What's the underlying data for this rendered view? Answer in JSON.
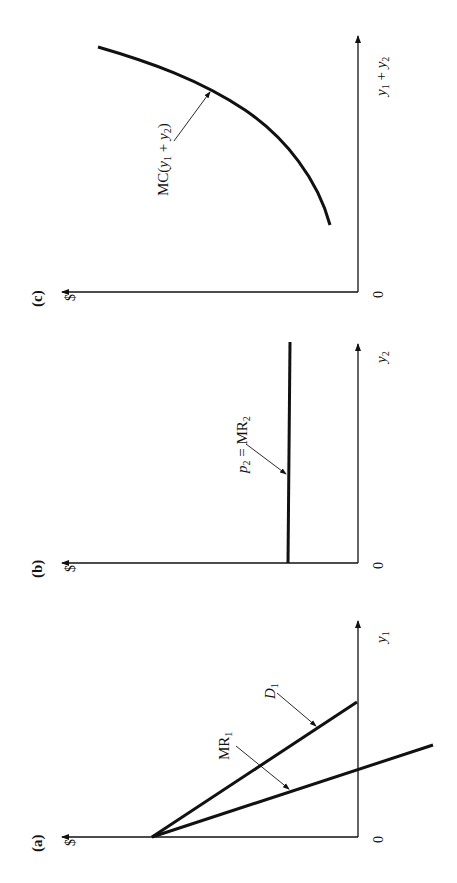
{
  "figure": {
    "ink_color": "#111111",
    "panels": [
      {
        "id": "a",
        "panel_label": "(a)",
        "y_axis_label": "$",
        "x_axis_label": "y",
        "x_axis_sub": "1",
        "origin_label": "0",
        "curves": [
          {
            "name": "D",
            "sub": "1",
            "type": "linear-downward",
            "desc": "Demand curve for market 1"
          },
          {
            "name": "MR",
            "sub": "1",
            "type": "linear-downward-steeper",
            "desc": "Marginal revenue for market 1"
          }
        ]
      },
      {
        "id": "b",
        "panel_label": "(b)",
        "y_axis_label": "$",
        "x_axis_label": "y",
        "x_axis_sub": "2",
        "origin_label": "0",
        "curves": [
          {
            "name_p": "p",
            "p_sub": "2",
            "eq": " = ",
            "name_mr": "MR",
            "mr_sub": "2",
            "type": "horizontal",
            "desc": "Price equals marginal revenue in competitive market 2"
          }
        ]
      },
      {
        "id": "c",
        "panel_label": "(c)",
        "y_axis_label": "$",
        "x_axis_label_parts": {
          "a": "y",
          "a_sub": "1",
          "plus": " + ",
          "b": "y",
          "b_sub": "2"
        },
        "origin_label": "0",
        "curves": [
          {
            "prefix": "MC(",
            "a": "y",
            "a_sub": "1",
            "plus": " + ",
            "b": "y",
            "b_sub": "2",
            "suffix": ")",
            "type": "increasing-convex",
            "desc": "Marginal cost of total output"
          }
        ]
      }
    ]
  }
}
